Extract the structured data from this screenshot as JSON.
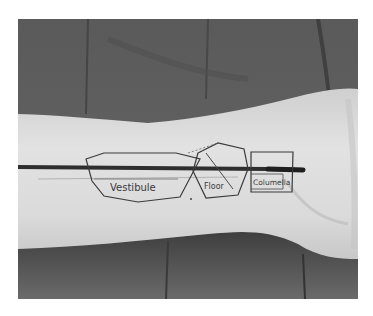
{
  "photo": {
    "description": "Forearm resting on dark fabric with a dark horizontal line and hand-drawn shapes labeled with anatomical terms",
    "labels": [
      {
        "text": "Vestibule"
      },
      {
        "text": "Floor"
      },
      {
        "text": "Columella"
      }
    ]
  },
  "colors": {
    "background": "#ffffff",
    "fabric": "#5c5c5c",
    "fabric_dark": "#3e3e3e",
    "skin": "#d8d8d8",
    "skin_light": "#e6e6e6",
    "ink": "#3a3a3a",
    "stripe": "#2e2e2e"
  }
}
